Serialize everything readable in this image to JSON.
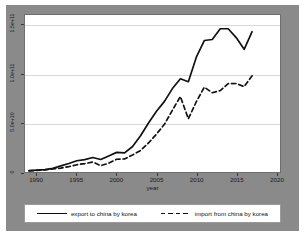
{
  "chart_data": {
    "type": "line",
    "title": "",
    "xlabel": "year",
    "ylabel": "",
    "xlim": [
      1988.5,
      2020.5
    ],
    "ylim": [
      0,
      160000000000
    ],
    "grid": true,
    "legend_position": "bottom",
    "x_ticks": [
      "1990",
      "1995",
      "2000",
      "2005",
      "2010",
      "2015",
      "2020"
    ],
    "x_tick_values": [
      1990,
      1995,
      2000,
      2005,
      2010,
      2015,
      2020
    ],
    "y_ticks": [
      "0",
      "5.0e+10",
      "1.0e+11",
      "1.5e+11"
    ],
    "y_tick_values": [
      0,
      50000000000,
      100000000000,
      150000000000
    ],
    "x": [
      1989,
      1990,
      1991,
      1992,
      1993,
      1994,
      1995,
      1996,
      1997,
      1998,
      1999,
      2000,
      2001,
      2002,
      2003,
      2004,
      2005,
      2006,
      2007,
      2008,
      2009,
      2010,
      2011,
      2012,
      2013,
      2014,
      2015,
      2016,
      2017
    ],
    "series": [
      {
        "name": "export to china by korea",
        "style": "solid",
        "color": "#111111",
        "values": [
          1400000000,
          1900000000,
          2400000000,
          3700000000,
          6200000000,
          8700000000,
          11500000000,
          12600000000,
          14800000000,
          12700000000,
          16300000000,
          20000000000,
          19500000000,
          26000000000,
          37000000000,
          50000000000,
          62000000000,
          72000000000,
          85000000000,
          95000000000,
          92000000000,
          117000000000,
          134000000000,
          135000000000,
          146000000000,
          146000000000,
          137000000000,
          125000000000,
          143000000000
        ]
      },
      {
        "name": "import from china by korea",
        "style": "dashed",
        "color": "#111111",
        "values": [
          1200000000,
          1700000000,
          2200000000,
          3100000000,
          4000000000,
          5500000000,
          7400000000,
          8600000000,
          10100000000,
          6500000000,
          8900000000,
          13000000000,
          13300000000,
          17400000000,
          21900000000,
          29600000000,
          38600000000,
          48600000000,
          63000000000,
          76900000000,
          54200000000,
          71600000000,
          86400000000,
          80800000000,
          83000000000,
          90100000000,
          90200000000,
          87000000000,
          98000000000
        ]
      }
    ]
  },
  "axes": {
    "y_tick_labels": [
      {
        "text": "0",
        "value": 0
      },
      {
        "text": "5.0e+10",
        "value": 50000000000
      },
      {
        "text": "1.0e+11",
        "value": 100000000000
      },
      {
        "text": "1.5e+11",
        "value": 150000000000
      }
    ],
    "x_tick_labels": [
      {
        "text": "1990",
        "value": 1990
      },
      {
        "text": "1995",
        "value": 1995
      },
      {
        "text": "2000",
        "value": 2000
      },
      {
        "text": "2005",
        "value": 2005
      },
      {
        "text": "2010",
        "value": 2010
      },
      {
        "text": "2015",
        "value": 2015
      },
      {
        "text": "2020",
        "value": 2020
      }
    ],
    "x_title": "year"
  },
  "legend": {
    "entries": [
      {
        "label": "export to china by korea",
        "style": "solid"
      },
      {
        "label": "import from china by korea",
        "style": "dashed"
      }
    ]
  },
  "colors": {
    "backdrop": "#8a8a8a",
    "plot_background": "#ffffff",
    "gridline": "#d8d8d8",
    "line": "#111111",
    "frame": "#6e6e6e"
  }
}
